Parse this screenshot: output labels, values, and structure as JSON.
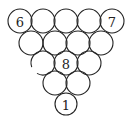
{
  "diagram": {
    "type": "billiard-ball-rack",
    "stroke_color": "#222222",
    "background": "#ffffff",
    "rows": [
      {
        "row": 1,
        "balls": [
          {
            "cx": 20,
            "cy": 21,
            "r": 12,
            "label": "6"
          },
          {
            "cx": 43,
            "cy": 21,
            "r": 12,
            "label": ""
          },
          {
            "cx": 66,
            "cy": 21,
            "r": 12,
            "label": ""
          },
          {
            "cx": 89,
            "cy": 21,
            "r": 12,
            "label": ""
          },
          {
            "cx": 112,
            "cy": 21,
            "r": 12,
            "label": "7"
          }
        ]
      },
      {
        "row": 2,
        "balls": [
          {
            "cx": 31,
            "cy": 43,
            "r": 12,
            "label": ""
          },
          {
            "cx": 55,
            "cy": 43,
            "r": 12,
            "label": ""
          },
          {
            "cx": 78,
            "cy": 43,
            "r": 12,
            "label": ""
          },
          {
            "cx": 101,
            "cy": 43,
            "r": 12,
            "label": ""
          }
        ]
      },
      {
        "row": 3,
        "balls": [
          {
            "cx": 43,
            "cy": 63,
            "r": 12,
            "label": "",
            "broken": true
          },
          {
            "cx": 66,
            "cy": 63,
            "r": 12,
            "label": "8"
          },
          {
            "cx": 89,
            "cy": 63,
            "r": 12,
            "label": ""
          }
        ]
      },
      {
        "row": 4,
        "balls": [
          {
            "cx": 55,
            "cy": 83,
            "r": 12,
            "label": ""
          },
          {
            "cx": 78,
            "cy": 83,
            "r": 12,
            "label": ""
          }
        ]
      },
      {
        "row": 5,
        "balls": [
          {
            "cx": 66,
            "cy": 104,
            "r": 11,
            "label": "1"
          }
        ]
      }
    ],
    "labels": {
      "top_left": "6",
      "top_right": "7",
      "center": "8",
      "bottom": "1"
    }
  }
}
